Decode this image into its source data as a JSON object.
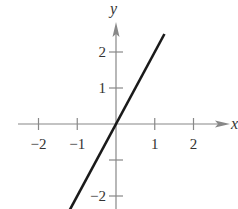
{
  "chart_data": {
    "type": "line",
    "title": "",
    "xlabel": "x",
    "ylabel": "y",
    "xlim": [
      -2.5,
      3
    ],
    "ylim": [
      -2.4,
      2.6
    ],
    "grid": false,
    "x_ticks": [
      -2,
      -1,
      1,
      2
    ],
    "x_tick_labels": [
      "−2",
      "−1",
      "1",
      "2"
    ],
    "y_ticks": [
      -2,
      -1,
      1,
      2
    ],
    "y_tick_labels": [
      "−2",
      "",
      "1",
      "2"
    ],
    "series": [
      {
        "name": "y = 2x",
        "x": [
          -1.2,
          1.25
        ],
        "y": [
          -2.4,
          2.5
        ],
        "color": "#1a1a1a"
      }
    ]
  },
  "colors": {
    "axis": "#888888",
    "line": "#1a1a1a",
    "text": "#333333"
  }
}
